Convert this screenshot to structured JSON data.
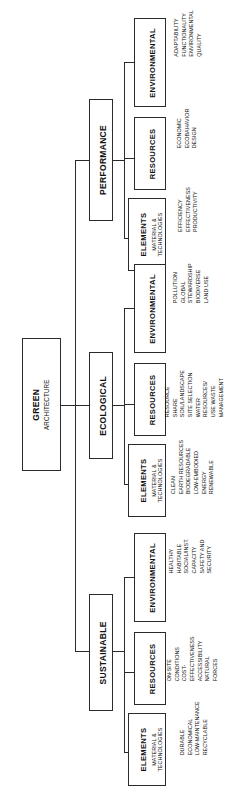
{
  "diagram": {
    "title": "GREEN ARCHITECTURE",
    "type": "tree",
    "orientation": "rotated-90-left",
    "line_color": "#2b2b2b",
    "background": "#ffffff",
    "root": {
      "title": "GREEN",
      "subtitle": "ARCHITECTURE"
    },
    "branches": [
      {
        "label": "PERFORMANCE",
        "children": [
          {
            "title": "ENVIRONMENTAL",
            "subtitle": "",
            "items": [
              "ADAPTABILITY",
              "FUNCTIONALITY",
              "ENVIRONMENTAL",
              "QUALITY"
            ]
          },
          {
            "title": "RESOURCES",
            "subtitle": "",
            "items": [
              "ECONOMIC",
              "ECOBAHAVIOR",
              "DESIGN"
            ]
          },
          {
            "title": "ELEMENTS",
            "subtitle": "MATERIAL &\nTECHNOLOGIES",
            "items": [
              "EFFICIENCY",
              "EFFECTIVENESS",
              "PRODUCTIVITY"
            ]
          }
        ]
      },
      {
        "label": "ECOLOGICAL",
        "children": [
          {
            "title": "ENVIRONMENTAL",
            "subtitle": "",
            "items": [
              "POLLUTION",
              "GLOBAL",
              "STEWARDSHIP",
              "BIODIVERSE",
              "LAND USE"
            ]
          },
          {
            "title": "RESOURCES",
            "subtitle": "",
            "items": [
              "RESOURCE",
              "SHARE",
              "SOIL/LANDSCAPE",
              "SITE SELECTION",
              "WATER",
              "RESOURCES/",
              "USE WASTE",
              "MANAGEMENT"
            ]
          },
          {
            "title": "ELEMENTS",
            "subtitle": "MATERIAL &\nTECHNOLOGIES",
            "items": [
              "CLEAN",
              "EARTH RESOURCES",
              "BIODEGRADABLE",
              "LOW-EMBODIED",
              "ENERGY",
              "RENEWABLE"
            ]
          }
        ]
      },
      {
        "label": "SUSTAINABLE",
        "children": [
          {
            "title": "ENVIRONMENTAL",
            "subtitle": "",
            "items": [
              "HEALTHY",
              "HABITABLE",
              "SOCIAL/INST.",
              "CAPACITY",
              "SAFETY AND",
              "SECURITY"
            ]
          },
          {
            "title": "RESOURCES",
            "subtitle": "",
            "items": [
              "ON-SITE",
              "CONDITIONS",
              "COST-",
              "EFFECTIVENESS",
              "ACCESSIBILITY",
              "NATURAL",
              "FORCES"
            ]
          },
          {
            "title": "ELEMENTS",
            "subtitle": "MATERIAL &\nTECHNOLOGIES",
            "items": [
              "DURABLE",
              "ECONOMICAL",
              "LOW-MAINTENANCE",
              "RECYCLABLE"
            ]
          }
        ]
      }
    ]
  }
}
